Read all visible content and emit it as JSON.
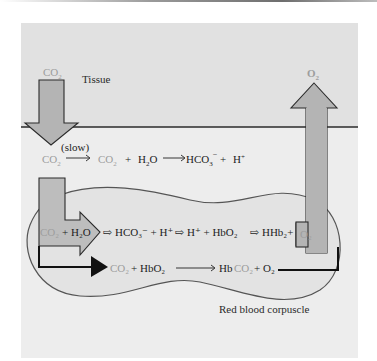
{
  "diagram": {
    "region_labels": {
      "tissue": "Tissue",
      "red_blood_corpuscle": "Red blood corpuscle"
    },
    "arrows": {
      "co2_in": {
        "label": "CO",
        "sub": "2",
        "direction": "down"
      },
      "o2_out": {
        "label": "O",
        "sub": "2",
        "direction": "up"
      }
    },
    "plasma_reaction": {
      "reactant": {
        "text": "CO",
        "sub": "2"
      },
      "condition": "(slow)",
      "step2": [
        {
          "text": "CO",
          "sub": "2"
        },
        {
          "text": "+"
        },
        {
          "text": "H",
          "sub": "2",
          "tail": "O"
        }
      ],
      "products": [
        {
          "text": "HCO",
          "sub": "3",
          "sup": "−"
        },
        {
          "text": "+"
        },
        {
          "text": "H",
          "sup": "+"
        }
      ]
    },
    "cell_reaction_1": {
      "terms": [
        "CO₂",
        "+ H₂O",
        "⇨ HCO₃⁻ + H⁺",
        "⇨ H⁺ + HbO₂",
        "⇨ HHb₂+",
        "O₂"
      ]
    },
    "cell_reaction_2": {
      "terms": [
        "CO₂",
        "+ HbO₂",
        "→",
        "Hb",
        "CO₂",
        "+ O₂"
      ]
    },
    "colors": {
      "tissue_bg": "#e1e1e1",
      "plasma_bg": "#ededed",
      "cell_fill": "#e3e3e3",
      "arrow_fill": "#b4b4b4",
      "grey_text": "#9d9d9d",
      "outline": "#1e1e1e"
    }
  }
}
